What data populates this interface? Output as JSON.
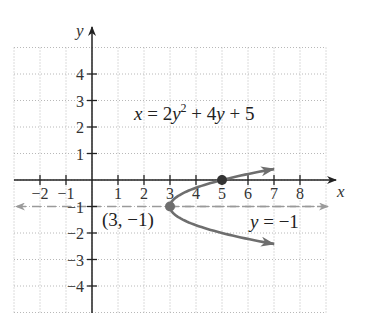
{
  "chart_data": {
    "type": "line",
    "title": "",
    "equation": "x = 2y² + 4y + 5",
    "xlabel": "x",
    "ylabel": "y",
    "xlim": [
      -3,
      9
    ],
    "ylim": [
      -5,
      5
    ],
    "grid": true,
    "x_ticks": [
      -2,
      -1,
      1,
      2,
      3,
      4,
      5,
      6,
      7,
      8
    ],
    "x_tick_labels": [
      "−2",
      "−1",
      "1",
      "2",
      "3",
      "4",
      "5",
      "6",
      "7",
      "8"
    ],
    "y_ticks": [
      4,
      3,
      2,
      1,
      -1,
      -2,
      -3,
      -4
    ],
    "y_tick_labels": [
      "4",
      "3",
      "2",
      "1",
      "−1",
      "−2",
      "−3",
      "−4"
    ],
    "series": [
      {
        "name": "x = 2y² + 4y + 5",
        "kind": "parabola",
        "color": "#6e6e6e",
        "points": [
          [
            9,
            0.414
          ],
          [
            7,
            0
          ],
          [
            5,
            0
          ],
          [
            3.5,
            -0.5
          ],
          [
            3,
            -1
          ],
          [
            3.5,
            -1.5
          ],
          [
            5,
            -2
          ],
          [
            7,
            -2
          ],
          [
            9,
            -2.414
          ]
        ]
      },
      {
        "name": "y = −1",
        "kind": "axis-of-symmetry",
        "style": "dashed",
        "color": "#9a9a9a",
        "points": [
          [
            -3,
            -1
          ],
          [
            9,
            -1
          ]
        ]
      }
    ],
    "annotations": [
      {
        "text": "x = 2y² + 4y + 5",
        "x": 4.5,
        "y": 3
      },
      {
        "text": "(3, −1)",
        "point": [
          3,
          -1
        ],
        "marker": "vertex"
      },
      {
        "text": "y = −1",
        "x": 7.5,
        "y": -1.5
      },
      {
        "point": [
          5,
          0
        ],
        "marker": "x-intercept"
      }
    ]
  },
  "labels": {
    "x_axis": "x",
    "y_axis": "y",
    "equation_x": "x",
    "equation_rest1": " = 2",
    "equation_y1": "y",
    "equation_sup": "2",
    "equation_rest2": " + 4",
    "equation_y2": "y",
    "equation_rest3": " + 5",
    "vertex": "(3, −1)",
    "line_y": "y",
    "line_rest": " = −1"
  }
}
